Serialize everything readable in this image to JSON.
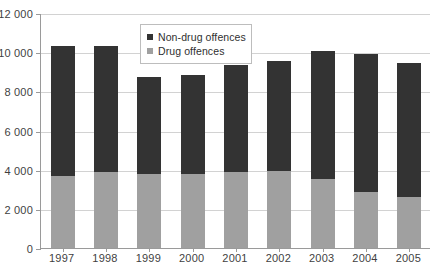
{
  "chart_data": {
    "type": "bar",
    "stacked": true,
    "title": "",
    "xlabel": "",
    "ylabel": "",
    "categories": [
      "1997",
      "1998",
      "1999",
      "2000",
      "2001",
      "2002",
      "2003",
      "2004",
      "2005"
    ],
    "series": [
      {
        "name": "Drug offences",
        "color": "#a0a0a0",
        "values": [
          3700,
          3900,
          3800,
          3800,
          3900,
          3950,
          3500,
          2850,
          2600
        ]
      },
      {
        "name": "Non-drug offences",
        "color": "#333333",
        "values": [
          6600,
          6400,
          4950,
          5050,
          5450,
          5600,
          6550,
          7050,
          6850
        ]
      }
    ],
    "totals": [
      10300,
      10300,
      8750,
      8850,
      9350,
      9550,
      10050,
      9900,
      9450
    ],
    "ylim": [
      0,
      12000
    ],
    "ytick_step": 2000,
    "ytick_labels": [
      "0",
      "2 000",
      "4 000",
      "6 000",
      "8 000",
      "10 000",
      "12 000"
    ],
    "ytick_values": [
      0,
      2000,
      4000,
      6000,
      8000,
      10000,
      12000
    ],
    "grid": true,
    "legend_position": "top-center"
  },
  "legend": {
    "entries": [
      {
        "label": "Non-drug offences",
        "color": "#333333"
      },
      {
        "label": "Drug offences",
        "color": "#a0a0a0"
      }
    ]
  },
  "colors": {
    "non_drug": "#333333",
    "drug": "#a0a0a0",
    "grid": "#d2d2d2",
    "axis": "#9a9a9a",
    "text": "#3f3f3f",
    "background": "#ffffff"
  }
}
